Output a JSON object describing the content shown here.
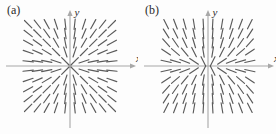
{
  "figure": {
    "background_color": "#fdfdfd",
    "panel_count": 2,
    "segment_color": "#5a5a5a",
    "axis_color": "#a8a8a8"
  },
  "panels": [
    {
      "label": "(a)",
      "axis_x_label": "x",
      "axis_y_label": "y",
      "origin": {
        "x": 70,
        "y": 66
      },
      "chart_data": {
        "type": "scatter",
        "plot_kind": "direction-field",
        "title": "(a)",
        "xlabel": "x",
        "ylabel": "y",
        "slope_rule": "dy/dx = y/x",
        "grid": false,
        "legend": null,
        "xlim": [
          -5.5,
          5.5
        ],
        "ylim": [
          -5.5,
          5.5
        ],
        "grid_x": [
          -4.5,
          -3.5,
          -2.5,
          -1.5,
          -0.5,
          0.5,
          1.5,
          2.5,
          3.5,
          4.5
        ],
        "grid_y": [
          4.5,
          3.5,
          2.5,
          1.5,
          0.5,
          -0.5,
          -1.5,
          -2.5,
          -3.5,
          -4.5
        ],
        "segment_half_length": 5.2,
        "axes_arrows": [
          "x-positive",
          "y-positive"
        ],
        "description": "Radial direction field; slope equals y divided by x, so segments point outward along rays from the origin. Near the x-axis segments are nearly horizontal; near the y-axis they are nearly vertical."
      }
    },
    {
      "label": "(b)",
      "axis_x_label": "x",
      "axis_y_label": "y",
      "origin": {
        "x": 70,
        "y": 66
      },
      "chart_data": {
        "type": "scatter",
        "plot_kind": "direction-field",
        "title": "(b)",
        "xlabel": "x",
        "ylabel": "y",
        "slope_rule": "dy/dx = 2y/x",
        "grid": false,
        "legend": null,
        "xlim": [
          -5.5,
          5.5
        ],
        "ylim": [
          -5.5,
          5.5
        ],
        "grid_x": [
          -4.5,
          -3.5,
          -2.5,
          -1.5,
          -0.5,
          0.5,
          1.5,
          2.5,
          3.5,
          4.5
        ],
        "grid_y": [
          4.5,
          3.5,
          2.5,
          1.5,
          0.5,
          -0.5,
          -1.5,
          -2.5,
          -3.5,
          -4.5
        ],
        "segment_half_length": 5.2,
        "axes_arrows": [
          "x-positive",
          "y-positive"
        ],
        "description": "Direction field with steeper radial slopes; segments are more vertical than panel (a) away from the x-axis, flattening only very close to the x-axis."
      }
    }
  ]
}
